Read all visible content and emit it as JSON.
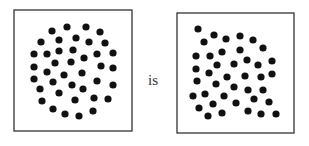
{
  "connector_word": "is",
  "colors": {
    "dot": "#111111",
    "frame": "#333333",
    "background": "#ffffff"
  },
  "panels": [
    {
      "name": "circular-dot-pattern",
      "frame": {
        "x": 14,
        "y": 10,
        "w": 118,
        "h": 121
      },
      "dot_radius": 3.6,
      "dots": [
        [
          52,
          31
        ],
        [
          67,
          27
        ],
        [
          86,
          27
        ],
        [
          100,
          32
        ],
        [
          41,
          42
        ],
        [
          59,
          40
        ],
        [
          76,
          38
        ],
        [
          89,
          42
        ],
        [
          105,
          43
        ],
        [
          34,
          54
        ],
        [
          47,
          54
        ],
        [
          59,
          51
        ],
        [
          73,
          50
        ],
        [
          97,
          54
        ],
        [
          113,
          53
        ],
        [
          34,
          67
        ],
        [
          55,
          63
        ],
        [
          71,
          62
        ],
        [
          84,
          58
        ],
        [
          101,
          66
        ],
        [
          113,
          68
        ],
        [
          34,
          79
        ],
        [
          47,
          72
        ],
        [
          64,
          75
        ],
        [
          82,
          73
        ],
        [
          113,
          85
        ],
        [
          40,
          89
        ],
        [
          53,
          82
        ],
        [
          72,
          85
        ],
        [
          83,
          89
        ],
        [
          97,
          81
        ],
        [
          42,
          101
        ],
        [
          59,
          93
        ],
        [
          75,
          100
        ],
        [
          94,
          98
        ],
        [
          108,
          99
        ],
        [
          53,
          109
        ],
        [
          65,
          114
        ],
        [
          79,
          116
        ],
        [
          93,
          111
        ]
      ]
    },
    {
      "name": "irregular-dot-pattern",
      "frame": {
        "x": 177,
        "y": 13,
        "w": 117,
        "h": 120
      },
      "dot_radius": 3.6,
      "dots": [
        [
          198,
          29
        ],
        [
          214,
          35
        ],
        [
          204,
          42
        ],
        [
          226,
          39
        ],
        [
          240,
          36
        ],
        [
          253,
          40
        ],
        [
          263,
          48
        ],
        [
          240,
          50
        ],
        [
          222,
          52
        ],
        [
          210,
          56
        ],
        [
          196,
          56
        ],
        [
          217,
          65
        ],
        [
          234,
          64
        ],
        [
          247,
          60
        ],
        [
          258,
          65
        ],
        [
          272,
          61
        ],
        [
          196,
          69
        ],
        [
          209,
          73
        ],
        [
          227,
          77
        ],
        [
          245,
          76
        ],
        [
          261,
          77
        ],
        [
          272,
          74
        ],
        [
          197,
          81
        ],
        [
          216,
          84
        ],
        [
          234,
          87
        ],
        [
          248,
          90
        ],
        [
          263,
          90
        ],
        [
          193,
          96
        ],
        [
          205,
          94
        ],
        [
          224,
          96
        ],
        [
          254,
          99
        ],
        [
          269,
          102
        ],
        [
          199,
          108
        ],
        [
          213,
          104
        ],
        [
          236,
          103
        ],
        [
          208,
          116
        ],
        [
          222,
          113
        ],
        [
          248,
          111
        ],
        [
          261,
          114
        ],
        [
          276,
          114
        ]
      ]
    }
  ]
}
